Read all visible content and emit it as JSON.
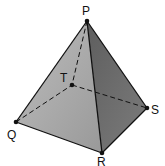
{
  "diagram": {
    "type": "square-based pyramid",
    "vertices": {
      "P": {
        "label": "P",
        "x": 87,
        "y": 21
      },
      "Q": {
        "label": "Q",
        "x": 16,
        "y": 122
      },
      "R": {
        "label": "R",
        "x": 102,
        "y": 153
      },
      "S": {
        "label": "S",
        "x": 147,
        "y": 108
      },
      "T": {
        "label": "T",
        "x": 72,
        "y": 85
      }
    },
    "visible_edges": [
      "PQ",
      "PR",
      "PS",
      "QR",
      "RS"
    ],
    "hidden_edges": [
      "PT",
      "QT",
      "TS"
    ],
    "colors": {
      "left_face": "#a9a9a9",
      "right_face": "#6f6f6f",
      "edge": "#111111"
    }
  }
}
